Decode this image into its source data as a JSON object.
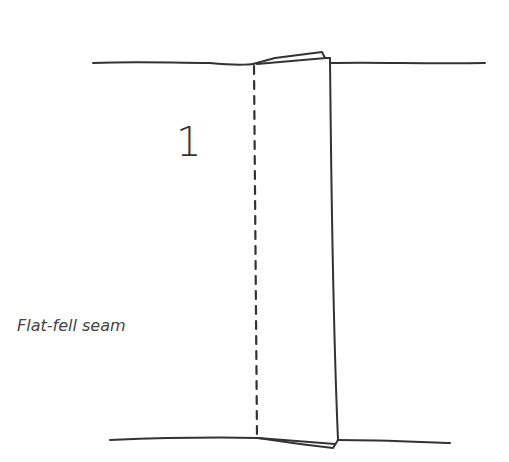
{
  "diagram": {
    "step_number": "1",
    "caption": "Flat-fell seam",
    "colors": {
      "stroke": "#333333",
      "text": "#444444",
      "background": "#ffffff"
    }
  }
}
